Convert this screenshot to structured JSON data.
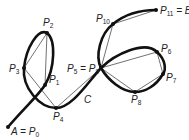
{
  "diagram": {
    "type": "curve-polygonal-approximation",
    "curve_label": "C",
    "points": [
      {
        "id": "P0",
        "label": "A = P",
        "sub": "0",
        "x": 8,
        "y": 127
      },
      {
        "id": "P1",
        "label": "P",
        "sub": "1",
        "x": 45,
        "y": 85
      },
      {
        "id": "P2",
        "label": "P",
        "sub": "2",
        "x": 47,
        "y": 33
      },
      {
        "id": "P3",
        "label": "P",
        "sub": "3",
        "x": 24,
        "y": 68
      },
      {
        "id": "P4",
        "label": "P",
        "sub": "4",
        "x": 56,
        "y": 108
      },
      {
        "id": "P5",
        "label": "P",
        "sub": "5",
        "x": 101,
        "y": 68
      },
      {
        "id": "P6",
        "label": "P",
        "sub": "6",
        "x": 157,
        "y": 52
      },
      {
        "id": "P7",
        "label": "P",
        "sub": "7",
        "x": 163,
        "y": 74
      },
      {
        "id": "P8",
        "label": "P",
        "sub": "8",
        "x": 135,
        "y": 92
      },
      {
        "id": "P9",
        "label": "P",
        "sub": "9",
        "x": 101,
        "y": 68
      },
      {
        "id": "P10",
        "label": "P",
        "sub": "10",
        "x": 113,
        "y": 24
      },
      {
        "id": "P11",
        "label": "P",
        "sub": "11",
        "x": 156,
        "y": 10
      }
    ],
    "labels": {
      "p0": {
        "main": "A = P",
        "sub": "0"
      },
      "p1": {
        "main": "P",
        "sub": "1"
      },
      "p2": {
        "main": "P",
        "sub": "2"
      },
      "p3": {
        "main": "P",
        "sub": "3"
      },
      "p4": {
        "main": "P",
        "sub": "4"
      },
      "p5p9_a": {
        "main": "P",
        "sub": "5"
      },
      "p5p9_eq": " = P",
      "p5p9_b": {
        "sub": "9"
      },
      "p6": {
        "main": "P",
        "sub": "6"
      },
      "p7": {
        "main": "P",
        "sub": "7"
      },
      "p8": {
        "main": "P",
        "sub": "8"
      },
      "p10": {
        "main": "P",
        "sub": "10"
      },
      "p11": {
        "main": "P",
        "sub": "11",
        "suffix": " = B"
      },
      "curve": "C"
    }
  }
}
